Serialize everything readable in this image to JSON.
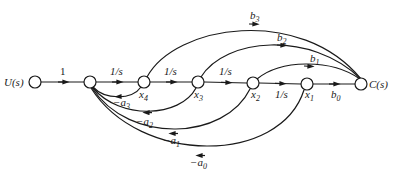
{
  "diagram": {
    "type": "signal-flow-graph",
    "nodes": [
      {
        "id": "U",
        "label": "U(s)",
        "x": 35,
        "y": 82
      },
      {
        "id": "n1",
        "label": "",
        "x": 90,
        "y": 82
      },
      {
        "id": "x4",
        "label": "x",
        "sub": "4",
        "x": 144,
        "y": 82
      },
      {
        "id": "x3",
        "label": "x",
        "sub": "3",
        "x": 198,
        "y": 82
      },
      {
        "id": "x2",
        "label": "x",
        "sub": "2",
        "x": 253,
        "y": 83
      },
      {
        "id": "x1",
        "label": "x",
        "sub": "1",
        "x": 307,
        "y": 84
      },
      {
        "id": "C",
        "label": "C(s)",
        "x": 361,
        "y": 84
      }
    ],
    "forward_edges": [
      {
        "from": "U",
        "to": "n1",
        "gain": "1"
      },
      {
        "from": "n1",
        "to": "x4",
        "gain": "1/s"
      },
      {
        "from": "x4",
        "to": "x3",
        "gain": "1/s"
      },
      {
        "from": "x3",
        "to": "x2",
        "gain": "1/s"
      },
      {
        "from": "x2",
        "to": "x1",
        "gain": "1/s"
      },
      {
        "from": "x1",
        "to": "C",
        "gain": "b",
        "sub": "0"
      }
    ],
    "output_edges": [
      {
        "from": "x4",
        "to": "C",
        "gain": "b",
        "sub": "3"
      },
      {
        "from": "x3",
        "to": "C",
        "gain": "b",
        "sub": "2"
      },
      {
        "from": "x2",
        "to": "C",
        "gain": "b",
        "sub": "1"
      }
    ],
    "feedback_edges": [
      {
        "from": "x4",
        "to": "n1",
        "gain": "−a",
        "sub": "3"
      },
      {
        "from": "x3",
        "to": "n1",
        "gain": "−a",
        "sub": "2"
      },
      {
        "from": "x2",
        "to": "n1",
        "gain": "−a",
        "sub": "1"
      },
      {
        "from": "x1",
        "to": "n1",
        "gain": "−a",
        "sub": "0"
      }
    ]
  },
  "labels": {
    "input": "U(s)",
    "output": "C(s)",
    "g_1": "1",
    "g_int": "1/s",
    "b": "b",
    "b0": "0",
    "b1": "1",
    "b2": "2",
    "b3": "3",
    "x": "x",
    "x1": "1",
    "x2": "2",
    "x3": "3",
    "x4": "4",
    "na": "−a",
    "a0": "0",
    "a1": "1",
    "a2": "2",
    "a3": "3"
  }
}
